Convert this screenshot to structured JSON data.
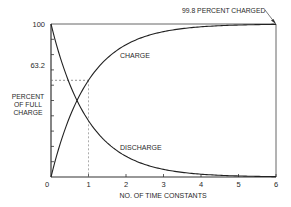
{
  "chart_data": {
    "type": "line",
    "title": "",
    "xlabel": "NO. OF TIME CONSTANTS",
    "ylabel": [
      "PERCENT",
      "OF FULL",
      "CHARGE"
    ],
    "xlim": [
      0,
      6
    ],
    "ylim": [
      0,
      100
    ],
    "x_ticks": [
      "0",
      "1",
      "2",
      "3",
      "4",
      "5",
      "6"
    ],
    "y_ticks": [
      "0",
      "100"
    ],
    "grid": false,
    "series": [
      {
        "name": "CHARGE",
        "x": [
          0,
          0.5,
          1,
          1.5,
          2,
          2.5,
          3,
          3.5,
          4,
          4.5,
          5,
          5.5,
          6
        ],
        "values": [
          0,
          39.3,
          63.2,
          77.7,
          86.5,
          91.8,
          95.0,
          97.0,
          98.2,
          98.9,
          99.3,
          99.6,
          99.8
        ]
      },
      {
        "name": "DISCHARGE",
        "x": [
          0,
          0.5,
          1,
          1.5,
          2,
          2.5,
          3,
          3.5,
          4,
          4.5,
          5,
          5.5,
          6
        ],
        "values": [
          100,
          60.7,
          36.8,
          22.3,
          13.5,
          8.2,
          5.0,
          3.0,
          1.8,
          1.1,
          0.7,
          0.4,
          0.2
        ]
      }
    ],
    "annotations": [
      {
        "text": "63.2",
        "type": "reference-lines",
        "x": 1,
        "y": 63.2
      },
      {
        "text": "99.8 PERCENT CHARGED",
        "type": "arrow-label",
        "x": 6,
        "y": 99.8
      },
      {
        "text": "CHARGE",
        "type": "series-label"
      },
      {
        "text": "DISCHARGE",
        "type": "series-label"
      }
    ]
  },
  "labels": {
    "y_top": "100",
    "y_ref": "63.2",
    "y_title_1": "PERCENT",
    "y_title_2": "OF FULL",
    "y_title_3": "CHARGE",
    "x_title": "NO. OF TIME CONSTANTS",
    "charge": "CHARGE",
    "discharge": "DISCHARGE",
    "callout": "99.8 PERCENT CHARGED",
    "x0": "0",
    "x1": "1",
    "x2": "2",
    "x3": "3",
    "x4": "4",
    "x5": "5",
    "x6": "6"
  }
}
